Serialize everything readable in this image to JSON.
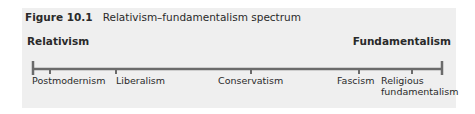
{
  "figure": {
    "number": "Figure 10.1",
    "title": "Relativism–fundamentalism spectrum"
  },
  "spectrum": {
    "left_end": "Relativism",
    "right_end": "Fundamentalism",
    "line_color": "#6b6b6b",
    "points": [
      {
        "label": "Postmodernism",
        "position": 0.04
      },
      {
        "label": "Liberalism",
        "position": 0.2
      },
      {
        "label": "Conservatism",
        "position": 0.53
      },
      {
        "label": "Fascism",
        "position": 0.8
      },
      {
        "label": "Religious fundamentalism",
        "label_line1": "Religious",
        "label_line2": "fundamentalism",
        "position": 0.93
      }
    ]
  }
}
